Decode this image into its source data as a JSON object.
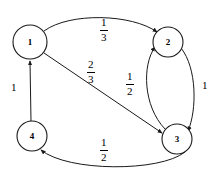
{
  "diagram": {
    "type": "directed-graph",
    "background_color": "#ffffff",
    "stroke_color": "#1a1a1a",
    "nodes": [
      {
        "id": "1",
        "label": "1",
        "cx": 30,
        "cy": 42,
        "r": 17
      },
      {
        "id": "2",
        "label": "2",
        "cx": 168,
        "cy": 42,
        "r": 15
      },
      {
        "id": "3",
        "label": "3",
        "cx": 177,
        "cy": 139,
        "r": 15
      },
      {
        "id": "4",
        "label": "4",
        "cx": 32,
        "cy": 136,
        "r": 15
      }
    ],
    "edges": [
      {
        "from": "1",
        "to": "2",
        "label": "1/3",
        "numerator": "1",
        "denominator": "3",
        "shape": "arc-top",
        "label_x": 100,
        "label_y": 17
      },
      {
        "from": "1",
        "to": "3",
        "label": "2/3",
        "numerator": "2",
        "denominator": "3",
        "shape": "straight-diagonal",
        "label_x": 87,
        "label_y": 59
      },
      {
        "from": "3",
        "to": "2",
        "label": "1/2",
        "numerator": "1",
        "denominator": "2",
        "shape": "arc-inner-left",
        "label_x": 126,
        "label_y": 71
      },
      {
        "from": "2",
        "to": "3",
        "label": "1",
        "numerator": "1",
        "denominator": "",
        "shape": "arc-outer-right",
        "label_x": 202,
        "label_y": 80
      },
      {
        "from": "3",
        "to": "4",
        "label": "1/2",
        "numerator": "1",
        "denominator": "2",
        "shape": "arc-bottom",
        "label_x": 100,
        "label_y": 137
      },
      {
        "from": "4",
        "to": "1",
        "label": "1",
        "numerator": "1",
        "denominator": "",
        "shape": "straight-vertical",
        "label_x": 11,
        "label_y": 82
      }
    ]
  }
}
